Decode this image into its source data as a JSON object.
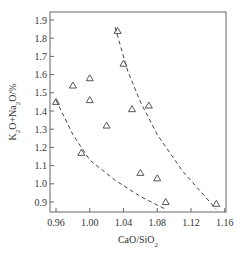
{
  "chart_data": {
    "type": "scatter",
    "title": "",
    "xlabel": "CaO/SiO2",
    "ylabel": "K2O+Na2O/%",
    "xlim": [
      0.95,
      1.16
    ],
    "ylim": [
      0.8,
      1.95
    ],
    "x_ticks": [
      "0.96",
      "1.00",
      "1.04",
      "1.08",
      "1.12",
      "1.16"
    ],
    "y_ticks": [
      "0.9",
      "1.0",
      "1.1",
      "1.2",
      "1.3",
      "1.4",
      "1.5",
      "1.6",
      "1.7",
      "1.8",
      "1.9"
    ],
    "grid": false,
    "legend": null,
    "marker": "triangle-open",
    "series": [
      {
        "name": "samples",
        "points": [
          {
            "x": 0.96,
            "y": 1.45
          },
          {
            "x": 0.98,
            "y": 1.54
          },
          {
            "x": 0.99,
            "y": 1.17
          },
          {
            "x": 1.0,
            "y": 1.58
          },
          {
            "x": 1.0,
            "y": 1.46
          },
          {
            "x": 1.02,
            "y": 1.32
          },
          {
            "x": 1.033,
            "y": 1.84
          },
          {
            "x": 1.04,
            "y": 1.66
          },
          {
            "x": 1.05,
            "y": 1.41
          },
          {
            "x": 1.07,
            "y": 1.43
          },
          {
            "x": 1.06,
            "y": 1.06
          },
          {
            "x": 1.08,
            "y": 1.03
          },
          {
            "x": 1.09,
            "y": 0.9
          },
          {
            "x": 1.15,
            "y": 0.89
          }
        ]
      }
    ],
    "boundary_lines": [
      {
        "name": "lower-dashed-boundary",
        "style": "dashed",
        "points": [
          [
            0.96,
            1.46
          ],
          [
            0.98,
            1.27
          ],
          [
            1.0,
            1.13
          ],
          [
            1.03,
            1.02
          ],
          [
            1.06,
            0.93
          ],
          [
            1.09,
            0.86
          ]
        ]
      },
      {
        "name": "upper-dashed-boundary",
        "style": "dashed",
        "points": [
          [
            1.03,
            1.86
          ],
          [
            1.045,
            1.62
          ],
          [
            1.06,
            1.45
          ],
          [
            1.08,
            1.27
          ],
          [
            1.11,
            1.07
          ],
          [
            1.15,
            0.86
          ]
        ]
      }
    ]
  }
}
